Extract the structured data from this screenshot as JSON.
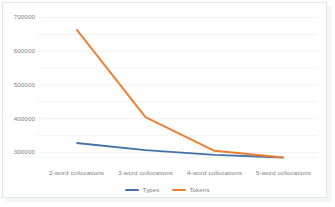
{
  "chart_data": {
    "type": "line",
    "title": "",
    "subtitle": "",
    "xlabel": "",
    "ylabel": "",
    "categories": [
      "2-word collocations",
      "3-word collocations",
      "4-word collocations",
      "5-word collocations"
    ],
    "series": [
      {
        "name": "Types",
        "color": "#4472a8",
        "values": [
          328000,
          307000,
          293000,
          285000
        ]
      },
      {
        "name": "Tokens",
        "color": "#ed7d31",
        "values": [
          665000,
          405000,
          305000,
          285000
        ]
      }
    ],
    "ylim": [
      283000,
      712000
    ],
    "yticks": [
      300000,
      400000,
      500000,
      600000,
      700000
    ],
    "ytick_labels": [
      "300000",
      "400000",
      "500000",
      "600000",
      "700000"
    ],
    "minor_yticks": [
      350000,
      450000,
      550000,
      650000
    ],
    "grid": "horizontal-major-and-minor",
    "legend_position": "bottom-center",
    "legend": [
      "Types",
      "Tokens"
    ],
    "annotations": []
  },
  "colors": {
    "types": "#4472a8",
    "tokens": "#ed7d31",
    "gridline": "#eceef0",
    "tick_text": "#808080",
    "frame": "#e2e5e9",
    "plot_background": "#ffffff"
  },
  "legend": {
    "items": [
      {
        "label": "Types",
        "color": "#4472a8"
      },
      {
        "label": "Tokens",
        "color": "#ed7d31"
      }
    ]
  }
}
